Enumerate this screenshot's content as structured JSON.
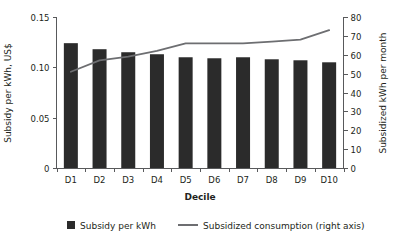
{
  "chart_data": {
    "type": "bar",
    "title": "",
    "subtitle": "",
    "xlabel": "Decile",
    "ylabel": "Subsidy per kWh, US$",
    "y2label": "Subsidized kWh per month",
    "categories": [
      "D1",
      "D2",
      "D3",
      "D4",
      "D5",
      "D6",
      "D7",
      "D8",
      "D9",
      "D10"
    ],
    "ylim": [
      0,
      0.15
    ],
    "y2lim": [
      0,
      80
    ],
    "yticks": [
      "0",
      "0.05",
      "0.10",
      "0.15"
    ],
    "ytick_values": [
      0,
      0.05,
      0.1,
      0.15
    ],
    "y2ticks": [
      "0",
      "10",
      "20",
      "30",
      "40",
      "50",
      "60",
      "70",
      "80"
    ],
    "y2tick_values": [
      0,
      10,
      20,
      30,
      40,
      50,
      60,
      70,
      80
    ],
    "grid": false,
    "legend_position": "bottom",
    "series": [
      {
        "name": "Subsidy per kWh",
        "kind": "bar",
        "axis": "left",
        "color": "#2b2b2b",
        "values": [
          0.124,
          0.118,
          0.115,
          0.113,
          0.11,
          0.109,
          0.11,
          0.108,
          0.107,
          0.105
        ]
      },
      {
        "name": "Subsidized consumption (right axis)",
        "kind": "line",
        "axis": "right",
        "color": "#6d6e71",
        "values": [
          51,
          57,
          59,
          62,
          66,
          66,
          66,
          67,
          68,
          73
        ]
      }
    ]
  },
  "legend": {
    "items": [
      {
        "label": "Subsidy per kWh",
        "marker": "square-marker",
        "color": "#2b2b2b"
      },
      {
        "label": "Subsidized consumption (right axis)",
        "marker": "line-marker",
        "color": "#6d6e71"
      }
    ]
  }
}
